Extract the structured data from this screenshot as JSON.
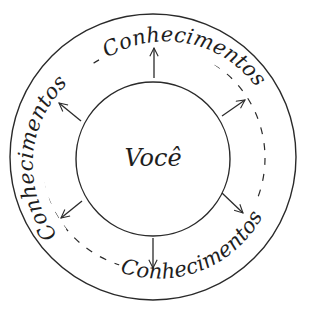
{
  "diagram": {
    "center_label": "Você",
    "ring_labels": [
      {
        "id": "top",
        "text": "Conhecimentos"
      },
      {
        "id": "left",
        "text": "Conhecimentos"
      },
      {
        "id": "bottom-right",
        "text": "Conhecimentos"
      },
      {
        "id": "bottom",
        "text": "Conhecimentos"
      }
    ],
    "arrows": [
      {
        "direction": "up"
      },
      {
        "direction": "up-left"
      },
      {
        "direction": "up-right"
      },
      {
        "direction": "down-left"
      },
      {
        "direction": "down-right"
      },
      {
        "direction": "down"
      }
    ],
    "colors": {
      "stroke": "#2a2a2a",
      "text": "#1e1e1e",
      "background": "#ffffff"
    }
  }
}
